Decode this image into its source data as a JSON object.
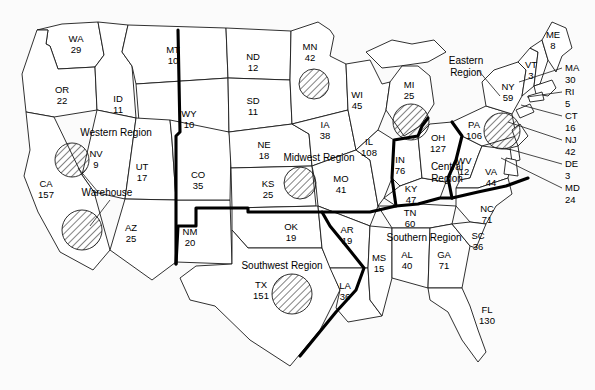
{
  "map": {
    "title": "US Sales by State Map",
    "background_color": "#fbfbfb",
    "state_fill": "#ffffff",
    "state_stroke": "#1a1a1a",
    "region_stroke": "#000000",
    "hatch_color": "#1a1a1a",
    "warehouse_label": "Warehouse",
    "regions": [
      {
        "id": "western",
        "label": "Western Region",
        "x": 116,
        "y": 136
      },
      {
        "id": "midwest",
        "label": "Midwest Region",
        "x": 319,
        "y": 161
      },
      {
        "id": "central",
        "label": "Central Region",
        "x": 447,
        "y": 170
      },
      {
        "id": "southwest",
        "label": "Southwest Region",
        "x": 282,
        "y": 269
      },
      {
        "id": "southern",
        "label": "Southern Region",
        "x": 424,
        "y": 241
      },
      {
        "id": "eastern",
        "label": "Eastern Region",
        "x": 466,
        "y": 64
      }
    ],
    "states": [
      {
        "abbr": "WA",
        "value": "29",
        "x": 76,
        "y": 42
      },
      {
        "abbr": "OR",
        "value": "22",
        "x": 62,
        "y": 93
      },
      {
        "abbr": "ID",
        "value": "11",
        "x": 118,
        "y": 102
      },
      {
        "abbr": "MT",
        "value": "10",
        "x": 173,
        "y": 53
      },
      {
        "abbr": "WY",
        "value": "10",
        "x": 189,
        "y": 117
      },
      {
        "abbr": "NV",
        "value": "9",
        "x": 96,
        "y": 157
      },
      {
        "abbr": "UT",
        "value": "17",
        "x": 142,
        "y": 170
      },
      {
        "abbr": "CA",
        "value": "157",
        "x": 46,
        "y": 187
      },
      {
        "abbr": "AZ",
        "value": "25",
        "x": 131,
        "y": 231
      },
      {
        "abbr": "NM",
        "value": "20",
        "x": 190,
        "y": 235
      },
      {
        "abbr": "CO",
        "value": "35",
        "x": 198,
        "y": 178
      },
      {
        "abbr": "ND",
        "value": "12",
        "x": 253,
        "y": 60
      },
      {
        "abbr": "SD",
        "value": "11",
        "x": 253,
        "y": 104
      },
      {
        "abbr": "NE",
        "value": "18",
        "x": 264,
        "y": 148
      },
      {
        "abbr": "KS",
        "value": "25",
        "x": 268,
        "y": 187
      },
      {
        "abbr": "OK",
        "value": "19",
        "x": 291,
        "y": 230
      },
      {
        "abbr": "TX",
        "value": "151",
        "x": 261,
        "y": 288
      },
      {
        "abbr": "MN",
        "value": "42",
        "x": 310,
        "y": 50
      },
      {
        "abbr": "IA",
        "value": "38",
        "x": 325,
        "y": 128
      },
      {
        "abbr": "MO",
        "value": "41",
        "x": 341,
        "y": 182
      },
      {
        "abbr": "AR",
        "value": "19",
        "x": 347,
        "y": 233
      },
      {
        "abbr": "LA",
        "value": "36",
        "x": 345,
        "y": 289
      },
      {
        "abbr": "WI",
        "value": "45",
        "x": 357,
        "y": 98
      },
      {
        "abbr": "IL",
        "value": "108",
        "x": 369,
        "y": 145
      },
      {
        "abbr": "MS",
        "value": "15",
        "x": 379,
        "y": 261
      },
      {
        "abbr": "MI",
        "value": "25",
        "x": 409,
        "y": 88
      },
      {
        "abbr": "IN",
        "value": "76",
        "x": 400,
        "y": 163
      },
      {
        "abbr": "KY",
        "value": "47",
        "x": 411,
        "y": 192
      },
      {
        "abbr": "TN",
        "value": "60",
        "x": 410,
        "y": 216
      },
      {
        "abbr": "AL",
        "value": "40",
        "x": 407,
        "y": 258
      },
      {
        "abbr": "OH",
        "value": "127",
        "x": 438,
        "y": 141
      },
      {
        "abbr": "GA",
        "value": "71",
        "x": 444,
        "y": 258
      },
      {
        "abbr": "WV",
        "value": "12",
        "x": 464,
        "y": 164
      },
      {
        "abbr": "PA",
        "value": "106",
        "x": 474,
        "y": 128
      },
      {
        "abbr": "VA",
        "value": "44",
        "x": 491,
        "y": 175
      },
      {
        "abbr": "NC",
        "value": "71",
        "x": 487,
        "y": 212
      },
      {
        "abbr": "SC",
        "value": "36",
        "x": 478,
        "y": 239
      },
      {
        "abbr": "FL",
        "value": "130",
        "x": 487,
        "y": 313
      },
      {
        "abbr": "NY",
        "value": "59",
        "x": 508,
        "y": 90
      },
      {
        "abbr": "VT",
        "value": "3",
        "x": 531,
        "y": 68
      },
      {
        "abbr": "ME",
        "value": "8",
        "x": 553,
        "y": 38
      }
    ],
    "side_states": [
      {
        "abbr": "MA",
        "value": "30",
        "x": 565,
        "y": 71,
        "lx": 562,
        "ly": 68,
        "tx": 519,
        "ty": 82
      },
      {
        "abbr": "RI",
        "value": "5",
        "x": 565,
        "y": 95,
        "lx": 562,
        "ly": 92,
        "tx": 527,
        "ty": 97
      },
      {
        "abbr": "CT",
        "value": "16",
        "x": 565,
        "y": 119,
        "lx": 562,
        "ly": 116,
        "tx": 521,
        "ty": 105
      },
      {
        "abbr": "NJ",
        "value": "42",
        "x": 565,
        "y": 143,
        "lx": 562,
        "ly": 140,
        "tx": 508,
        "ty": 122
      },
      {
        "abbr": "DE",
        "value": "3",
        "x": 565,
        "y": 167,
        "lx": 562,
        "ly": 164,
        "tx": 505,
        "ty": 148
      },
      {
        "abbr": "MD",
        "value": "24",
        "x": 565,
        "y": 191,
        "lx": 562,
        "ly": 188,
        "tx": 501,
        "ty": 158
      }
    ],
    "warehouses": [
      {
        "id": "wh-nv",
        "cx": 72,
        "cy": 160,
        "r": 17
      },
      {
        "id": "wh-ca",
        "cx": 82,
        "cy": 230,
        "r": 20
      },
      {
        "id": "wh-mn",
        "cx": 314,
        "cy": 84,
        "r": 15
      },
      {
        "id": "wh-ks",
        "cx": 300,
        "cy": 183,
        "r": 16
      },
      {
        "id": "wh-mi",
        "cx": 411,
        "cy": 122,
        "r": 18
      },
      {
        "id": "wh-pa",
        "cx": 502,
        "cy": 131,
        "r": 18
      },
      {
        "id": "wh-tx",
        "cx": 292,
        "cy": 294,
        "r": 20
      }
    ],
    "warehouse_label_pos": {
      "x": 107,
      "y": 196
    },
    "warehouse_leaders": [
      {
        "from_x": 98,
        "from_y": 192,
        "to_x": 78,
        "to_y": 168
      },
      {
        "from_x": 110,
        "from_y": 200,
        "to_x": 90,
        "to_y": 226
      }
    ]
  }
}
